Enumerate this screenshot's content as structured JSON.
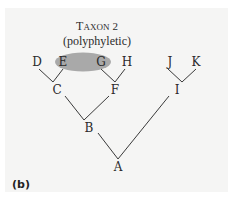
{
  "figure": {
    "panel_label": "(b)",
    "taxon_title_first": "T",
    "taxon_title_rest": "AXON",
    "taxon_number": "2",
    "taxon_type": "(polyphyletic)",
    "highlight_color": "#a9a9a9",
    "nodes": {
      "leaves": [
        "D",
        "E",
        "G",
        "H",
        "J",
        "K"
      ],
      "internal": [
        "C",
        "F",
        "I",
        "B"
      ],
      "root": "A"
    },
    "edges": [
      [
        "C",
        "D"
      ],
      [
        "C",
        "E"
      ],
      [
        "F",
        "G"
      ],
      [
        "F",
        "H"
      ],
      [
        "I",
        "J"
      ],
      [
        "I",
        "K"
      ],
      [
        "B",
        "C"
      ],
      [
        "B",
        "F"
      ],
      [
        "A",
        "B"
      ],
      [
        "A",
        "I"
      ]
    ],
    "highlighted_taxa": [
      "E",
      "G"
    ]
  }
}
